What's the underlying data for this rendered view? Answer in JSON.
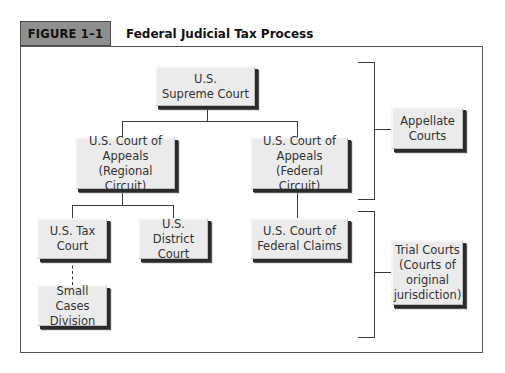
{
  "figure": {
    "label": "FIGURE 1–1",
    "title": "Federal Judicial Tax Process"
  },
  "nodes": {
    "supreme": "U.S.\nSupreme Court",
    "appeals_regional": "U.S. Court of\nAppeals\n(Regional Circuit)",
    "appeals_federal": "U.S. Court of\nAppeals\n(Federal Circuit)",
    "tax_court": "U.S. Tax\nCourt",
    "district_court": "U.S. District\nCourt",
    "federal_claims": "U.S. Court of\nFederal Claims",
    "small_cases": "Small Cases\nDivision"
  },
  "groups": {
    "appellate": "Appellate\nCourts",
    "trial": "Trial Courts\n(Courts of\noriginal\njurisdiction)"
  },
  "colors": {
    "header_fill": "#8f8f8f",
    "node_fill": "#ebebeb",
    "node_shadow": "#2a2a2a",
    "line": "#3a3a3a"
  }
}
